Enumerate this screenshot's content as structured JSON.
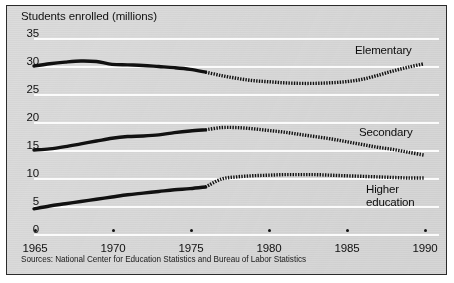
{
  "figure": {
    "title": "Students enrolled (millions)",
    "source_note": "Sources: National Center for Education Statistics and Bureau of Labor Statistics",
    "background_color": "#dcdcdc",
    "line_color": "#111111",
    "frame_color": "#2b2b2b"
  },
  "axes": {
    "y_ticks": [
      "35",
      "30",
      "25",
      "20",
      "15",
      "10",
      "5",
      "0"
    ],
    "x_ticks": [
      "1965",
      "1970",
      "1975",
      "1980",
      "1985",
      "1990"
    ]
  },
  "labels": {
    "elementary": "Elementary",
    "secondary": "Secondary",
    "higher_education": "Higher\neducation"
  },
  "chart_data": {
    "type": "line",
    "title": "Students enrolled (millions)",
    "subtitle": "",
    "xlabel": "",
    "ylabel": "Students enrolled (millions)",
    "xlim": [
      1965,
      1990
    ],
    "ylim": [
      0,
      35
    ],
    "grid": true,
    "legend_position": "inline-right-of-line-ends",
    "annotations": [
      "Solid line segments are historical (actual) data through about 1976.",
      "Dotted line segments from about 1976 to 1990 are projections."
    ],
    "x": [
      1965,
      1966,
      1967,
      1968,
      1969,
      1970,
      1971,
      1972,
      1973,
      1974,
      1975,
      1976,
      1977,
      1978,
      1979,
      1980,
      1981,
      1982,
      1983,
      1984,
      1985,
      1986,
      1987,
      1988,
      1989,
      1990
    ],
    "actual_range": [
      1965,
      1976
    ],
    "projected_range": [
      1976,
      1990
    ],
    "series": [
      {
        "name": "Elementary",
        "style": "solid-then-dotted",
        "values": [
          30.0,
          30.4,
          30.7,
          30.9,
          30.8,
          30.3,
          30.2,
          30.1,
          29.9,
          29.7,
          29.4,
          28.9,
          28.3,
          27.8,
          27.4,
          27.2,
          27.0,
          26.9,
          26.9,
          27.0,
          27.2,
          27.6,
          28.3,
          29.1,
          29.8,
          30.4
        ]
      },
      {
        "name": "Secondary",
        "style": "solid-then-dotted",
        "values": [
          15.0,
          15.2,
          15.6,
          16.1,
          16.6,
          17.1,
          17.4,
          17.5,
          17.7,
          18.1,
          18.4,
          18.6,
          19.0,
          19.0,
          18.8,
          18.5,
          18.2,
          17.8,
          17.4,
          17.0,
          16.5,
          16.0,
          15.5,
          15.1,
          14.6,
          14.1
        ]
      },
      {
        "name": "Higher education",
        "style": "solid-then-dotted",
        "values": [
          4.5,
          5.0,
          5.4,
          5.8,
          6.2,
          6.6,
          7.0,
          7.3,
          7.6,
          7.9,
          8.1,
          8.4,
          9.8,
          10.2,
          10.4,
          10.5,
          10.6,
          10.6,
          10.6,
          10.5,
          10.4,
          10.3,
          10.2,
          10.1,
          10.0,
          10.0
        ]
      }
    ]
  }
}
